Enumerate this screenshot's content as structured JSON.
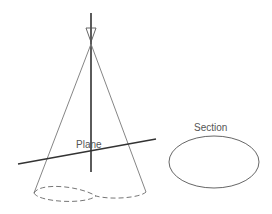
{
  "labels": {
    "plane": "Plane",
    "section": "Section"
  },
  "colors": {
    "line": "#333333",
    "thin": "#666666",
    "text": "#555555"
  }
}
